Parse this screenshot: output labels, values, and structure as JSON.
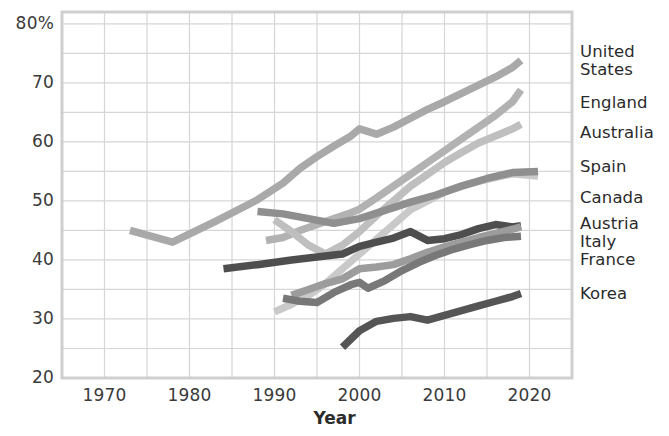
{
  "chart_data": {
    "type": "line",
    "title": "",
    "xlabel": "Year",
    "ylabel": "",
    "xlim": [
      1965,
      2025
    ],
    "ylim": [
      20,
      82
    ],
    "grid": true,
    "legend_position": "right-inline-labels",
    "x_ticks": [
      "1970",
      "1980",
      "1990",
      "2000",
      "2010",
      "2020"
    ],
    "x_tick_values": [
      1970,
      1980,
      1990,
      2000,
      2010,
      2020
    ],
    "y_ticks": [
      "20",
      "30",
      "40",
      "50",
      "60",
      "70",
      "80%"
    ],
    "y_tick_values": [
      20,
      30,
      40,
      50,
      60,
      70,
      80
    ],
    "series": [
      {
        "name": "United States",
        "color": "#a9a9a9",
        "label_top": 43,
        "points": [
          [
            1973,
            45.0
          ],
          [
            1978,
            43.0
          ],
          [
            1983,
            46.5
          ],
          [
            1988,
            50.2
          ],
          [
            1991,
            53.0
          ],
          [
            1993,
            55.5
          ],
          [
            1995,
            57.5
          ],
          [
            1997,
            59.3
          ],
          [
            1999,
            61.0
          ],
          [
            2000,
            62.2
          ],
          [
            2002,
            61.3
          ],
          [
            2004,
            62.5
          ],
          [
            2006,
            64.0
          ],
          [
            2008,
            65.5
          ],
          [
            2010,
            66.8
          ],
          [
            2012,
            68.2
          ],
          [
            2014,
            69.6
          ],
          [
            2016,
            71.0
          ],
          [
            2018,
            72.6
          ],
          [
            2019,
            73.8
          ]
        ]
      },
      {
        "name": "England",
        "color": "#b2b2b2",
        "label_top": 94,
        "points": [
          [
            1989,
            43.3
          ],
          [
            1991,
            43.8
          ],
          [
            1993,
            45.0
          ],
          [
            1995,
            46.0
          ],
          [
            1997,
            47.0
          ],
          [
            1999,
            48.0
          ],
          [
            2000,
            48.6
          ],
          [
            2002,
            50.5
          ],
          [
            2004,
            52.5
          ],
          [
            2006,
            54.5
          ],
          [
            2008,
            56.5
          ],
          [
            2010,
            58.5
          ],
          [
            2012,
            60.5
          ],
          [
            2014,
            62.5
          ],
          [
            2016,
            64.5
          ],
          [
            2018,
            66.8
          ],
          [
            2019,
            68.8
          ]
        ]
      },
      {
        "name": "Australia",
        "color": "#bfbfbf",
        "label_top": 124,
        "points": [
          [
            1990,
            46.8
          ],
          [
            1992,
            44.8
          ],
          [
            1994,
            42.5
          ],
          [
            1996,
            41.0
          ],
          [
            1998,
            42.5
          ],
          [
            2000,
            44.8
          ],
          [
            2002,
            47.5
          ],
          [
            2004,
            50.0
          ],
          [
            2006,
            52.5
          ],
          [
            2008,
            54.5
          ],
          [
            2010,
            56.5
          ],
          [
            2012,
            58.2
          ],
          [
            2014,
            59.8
          ],
          [
            2016,
            61.0
          ],
          [
            2018,
            62.2
          ],
          [
            2019,
            63.0
          ]
        ]
      },
      {
        "name": "Spain",
        "color": "#c9c9c9",
        "label_top": 158,
        "points": [
          [
            1990,
            31.2
          ],
          [
            1992,
            32.5
          ],
          [
            1994,
            34.0
          ],
          [
            1996,
            36.0
          ],
          [
            1998,
            38.5
          ],
          [
            2000,
            41.0
          ],
          [
            2002,
            43.5
          ],
          [
            2004,
            46.0
          ],
          [
            2006,
            48.5
          ],
          [
            2008,
            50.0
          ],
          [
            2010,
            51.5
          ],
          [
            2012,
            52.5
          ],
          [
            2014,
            53.3
          ],
          [
            2016,
            54.0
          ],
          [
            2018,
            54.6
          ],
          [
            2021,
            54.2
          ]
        ]
      },
      {
        "name": "Canada",
        "color": "#8f8f8f",
        "label_top": 189,
        "points": [
          [
            1988,
            48.2
          ],
          [
            1991,
            47.8
          ],
          [
            1994,
            47.0
          ],
          [
            1997,
            46.2
          ],
          [
            2000,
            47.0
          ],
          [
            2003,
            48.4
          ],
          [
            2006,
            49.8
          ],
          [
            2009,
            51.0
          ],
          [
            2012,
            52.5
          ],
          [
            2015,
            53.8
          ],
          [
            2018,
            54.8
          ],
          [
            2021,
            55.0
          ]
        ]
      },
      {
        "name": "Austria",
        "color": "#4e4e4e",
        "label_top": 215,
        "points": [
          [
            1984,
            38.5
          ],
          [
            1988,
            39.2
          ],
          [
            1992,
            40.0
          ],
          [
            1995,
            40.5
          ],
          [
            1998,
            41.0
          ],
          [
            2000,
            42.3
          ],
          [
            2002,
            43.0
          ],
          [
            2004,
            43.7
          ],
          [
            2006,
            44.8
          ],
          [
            2008,
            43.3
          ],
          [
            2010,
            43.6
          ],
          [
            2012,
            44.3
          ],
          [
            2014,
            45.3
          ],
          [
            2016,
            46.0
          ],
          [
            2018,
            45.6
          ],
          [
            2019,
            45.8
          ]
        ]
      },
      {
        "name": "Italy",
        "color": "#9c9c9c",
        "label_top": 233,
        "points": [
          [
            1992,
            34.0
          ],
          [
            1994,
            35.0
          ],
          [
            1996,
            36.0
          ],
          [
            1998,
            36.8
          ],
          [
            2000,
            38.5
          ],
          [
            2002,
            38.8
          ],
          [
            2004,
            39.2
          ],
          [
            2006,
            40.2
          ],
          [
            2008,
            41.3
          ],
          [
            2010,
            42.2
          ],
          [
            2012,
            43.0
          ],
          [
            2014,
            43.8
          ],
          [
            2016,
            44.5
          ],
          [
            2018,
            45.2
          ],
          [
            2019,
            45.6
          ]
        ]
      },
      {
        "name": "France",
        "color": "#787878",
        "label_top": 251,
        "points": [
          [
            1991,
            33.5
          ],
          [
            1993,
            33.0
          ],
          [
            1995,
            32.8
          ],
          [
            1997,
            34.5
          ],
          [
            1999,
            35.8
          ],
          [
            2000,
            36.2
          ],
          [
            2001,
            35.2
          ],
          [
            2003,
            36.5
          ],
          [
            2005,
            38.2
          ],
          [
            2007,
            39.6
          ],
          [
            2009,
            40.8
          ],
          [
            2011,
            41.8
          ],
          [
            2013,
            42.6
          ],
          [
            2015,
            43.3
          ],
          [
            2017,
            43.8
          ],
          [
            2019,
            44.0
          ]
        ]
      },
      {
        "name": "Korea",
        "color": "#555555",
        "label_top": 285,
        "points": [
          [
            1998,
            25.2
          ],
          [
            2000,
            28.0
          ],
          [
            2002,
            29.6
          ],
          [
            2004,
            30.1
          ],
          [
            2006,
            30.4
          ],
          [
            2008,
            29.8
          ],
          [
            2010,
            30.6
          ],
          [
            2012,
            31.4
          ],
          [
            2014,
            32.2
          ],
          [
            2016,
            33.0
          ],
          [
            2018,
            33.8
          ],
          [
            2019,
            34.3
          ]
        ]
      }
    ]
  },
  "axes": {
    "xlabel": "Year"
  },
  "style": {
    "grid_color": "#d6d6d6",
    "frame_color": "#cfcfcf",
    "tick_text_color": "#3a3a3a",
    "label_text_color": "#2b2b2b",
    "background": "#ffffff"
  }
}
